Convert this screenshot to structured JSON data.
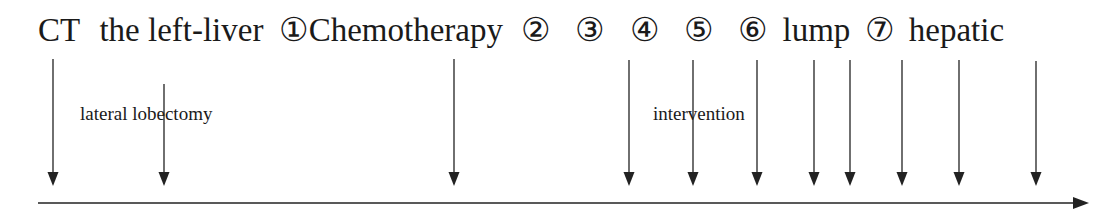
{
  "title_segments": [
    {
      "text": "CT",
      "gap_after": 11
    },
    {
      "text": "the left-liver",
      "gap_after": 7
    },
    {
      "text": "①Chemotherapy",
      "gap_after": 10
    },
    {
      "text": "②",
      "gap_after": 16
    },
    {
      "text": "③",
      "gap_after": 16
    },
    {
      "text": "④",
      "gap_after": 16
    },
    {
      "text": "⑤",
      "gap_after": 16
    },
    {
      "text": "⑥",
      "gap_after": 6
    },
    {
      "text": "lump",
      "gap_after": 6
    },
    {
      "text": "⑦",
      "gap_after": 6
    },
    {
      "text": "hepatic",
      "gap_after": 0
    }
  ],
  "sub_labels": {
    "lobectomy": {
      "text": "lateral lobectomy",
      "x": 80,
      "y": 103
    },
    "intervention": {
      "text": "intervention",
      "x": 653,
      "y": 103
    }
  },
  "timeline": {
    "axis": {
      "x_start": 38,
      "x_end": 1089,
      "y": 203,
      "color": "#222222"
    },
    "arrow_top_default": 59,
    "arrow_bottom": 186,
    "events": [
      {
        "x": 53,
        "top": 59
      },
      {
        "x": 164,
        "top": 84
      },
      {
        "x": 454,
        "top": 59
      },
      {
        "x": 629,
        "top": 60
      },
      {
        "x": 693,
        "top": 60
      },
      {
        "x": 757,
        "top": 60
      },
      {
        "x": 814,
        "top": 60
      },
      {
        "x": 850,
        "top": 60
      },
      {
        "x": 902,
        "top": 60
      },
      {
        "x": 959,
        "top": 60
      },
      {
        "x": 1036,
        "top": 61
      }
    ]
  }
}
